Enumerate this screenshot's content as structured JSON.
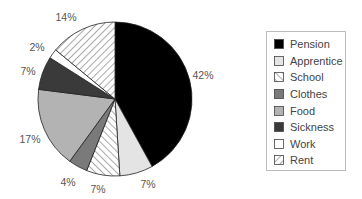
{
  "chart_data": {
    "type": "pie",
    "title": "",
    "start_angle_deg": 0,
    "direction": "clockwise",
    "slices": [
      {
        "label": "Pension",
        "value": 42,
        "display": "42%",
        "fill": "#000000",
        "pattern": "solid"
      },
      {
        "label": "Apprentice",
        "value": 7,
        "display": "7%",
        "fill": "#e4e4e4",
        "pattern": "solid"
      },
      {
        "label": "School",
        "value": 7,
        "display": "7%",
        "fill": "#ffffff",
        "pattern": "hatch-back"
      },
      {
        "label": "Clothes",
        "value": 4,
        "display": "4%",
        "fill": "#7a7a7a",
        "pattern": "solid"
      },
      {
        "label": "Food",
        "value": 17,
        "display": "17%",
        "fill": "#b3b3b3",
        "pattern": "solid"
      },
      {
        "label": "Sickness",
        "value": 7,
        "display": "7%",
        "fill": "#3a3a3a",
        "pattern": "solid"
      },
      {
        "label": "Work",
        "value": 2,
        "display": "2%",
        "fill": "#ffffff",
        "pattern": "solid"
      },
      {
        "label": "Rent",
        "value": 14,
        "display": "14%",
        "fill": "#ffffff",
        "pattern": "hatch-forward"
      }
    ],
    "legend": {
      "position": "right",
      "entries": [
        "Pension",
        "Apprentice",
        "School",
        "Clothes",
        "Food",
        "Sickness",
        "Work",
        "Rent"
      ]
    },
    "label_positions": [
      {
        "text": "42%",
        "x": 203,
        "y": 79
      },
      {
        "text": "7%",
        "x": 148,
        "y": 188
      },
      {
        "text": "7%",
        "x": 98,
        "y": 193
      },
      {
        "text": "4%",
        "x": 68,
        "y": 186
      },
      {
        "text": "17%",
        "x": 30,
        "y": 143
      },
      {
        "text": "7%",
        "x": 28,
        "y": 75
      },
      {
        "text": "2%",
        "x": 37,
        "y": 51
      },
      {
        "text": "14%",
        "x": 66,
        "y": 21
      }
    ]
  }
}
